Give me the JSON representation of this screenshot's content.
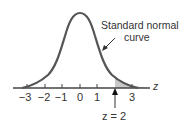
{
  "diagram": {
    "curve_label_line1": "Standard normal",
    "curve_label_line2": "curve",
    "axis_label": "z",
    "marker_label": "z = 2",
    "tick_labels": [
      "−3",
      "−2",
      "−1",
      "0",
      "1",
      "3"
    ],
    "tick_values": [
      -3,
      -2,
      -1,
      0,
      1,
      2,
      3
    ],
    "shaded_region": "z > 2",
    "colors": {
      "curve": "#555555",
      "shade": "#c8c8c8",
      "axis": "#444444",
      "text": "#333333"
    }
  }
}
